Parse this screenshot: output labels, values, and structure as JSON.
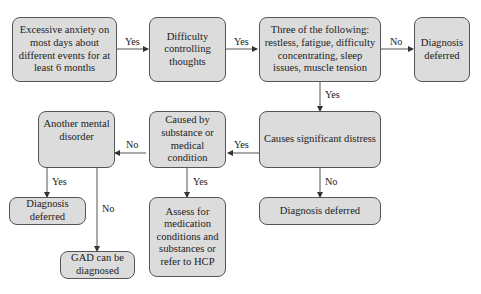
{
  "nodes": {
    "excessive_anxiety": "Excessive anxiety on most days about different events for at least 6 months",
    "difficulty_controlling": "Difficulty controlling thoughts",
    "three_symptoms": "Three of the following: restless, fatigue, difficulty concentrating, sleep issues, muscle tension",
    "deferred_top": "Diagnosis deferred",
    "significant_distress": "Causes significant distress",
    "deferred_distress": "Diagnosis deferred",
    "caused_by_substance": "Caused by substance or medical condition",
    "assess_medication": "Assess for medication conditions and substances or refer to HCP",
    "another_disorder": "Another mental disorder",
    "deferred_left": "Diagnosis deferred",
    "gad_diagnosed": "GAD can be diagnosed"
  },
  "edges": {
    "e1": "Yes",
    "e2": "Yes",
    "e3": "No",
    "e4": "Yes",
    "e5": "No",
    "e6": "Yes",
    "e7": "No",
    "e8": "Yes",
    "e9": "Yes",
    "e10": "No"
  },
  "colors": {
    "box_fill": "#dcdcdc",
    "box_border": "#555555",
    "arrow": "#333333"
  }
}
